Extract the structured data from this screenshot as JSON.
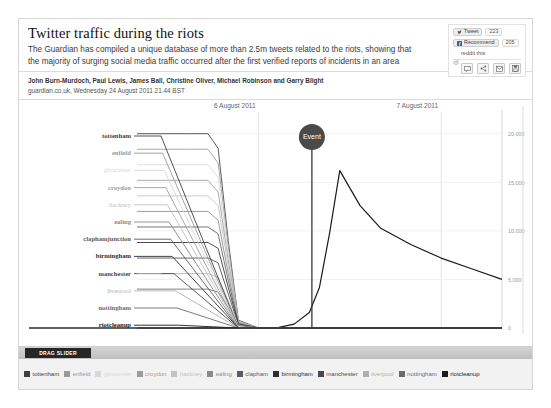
{
  "header": {
    "headline": "Twitter traffic during the riots",
    "standfirst": "The Guardian has compiled a unique database of more than 2.5m tweets related to the riots, showing that the majority of surging social media traffic occurred after the first verified reports of incidents in an area"
  },
  "social": {
    "tweet_label": "Tweet",
    "tweet_count": "223",
    "recommend_label": "Recommend",
    "recommend_count": "205",
    "reddit_label": "reddit this",
    "tools": [
      "comment-icon",
      "share-icon",
      "email-icon",
      "save-icon"
    ]
  },
  "byline": {
    "authors": "John Burn-Murdoch, Paul Lewis, James Ball, Christine Oliver, Michael Robinson and Garry Blight",
    "publication": "guardian.co.uk, Wednesday 24 August 2011 21.44 BST"
  },
  "slider": {
    "label": "DRAG SLIDER"
  },
  "chart_data": {
    "type": "line",
    "title": "Twitter traffic during the riots",
    "xlabel": "",
    "ylabel": "",
    "grid": true,
    "legend_position": "bottom",
    "annotations": [
      {
        "label": "Event",
        "x": "2011-08-07T00:30",
        "kind": "marker-circle"
      }
    ],
    "x_tick_labels": [
      "6 August 2011",
      "7 August 2011"
    ],
    "y_tick_labels": [
      "0",
      "5,000",
      "10,000",
      "15,000",
      "20,000"
    ],
    "ylim": [
      0,
      21000
    ],
    "yticks": [
      0,
      5000,
      10000,
      15000,
      20000
    ],
    "left_labels": [
      "tottenham",
      "enfield",
      "gloucester",
      "croydon",
      "hackney",
      "ealing",
      "claphamjunction",
      "birmingham",
      "manchester",
      "liverpool",
      "nottingham",
      "riotcleanup"
    ],
    "legend": [
      {
        "label": "tottenham",
        "color": "#3f3f3f"
      },
      {
        "label": "enfield",
        "color": "#9a9a9a"
      },
      {
        "label": "gloucester",
        "color": "#d8d8d8"
      },
      {
        "label": "croydon",
        "color": "#9d9d9d"
      },
      {
        "label": "hackney",
        "color": "#c2c2c2"
      },
      {
        "label": "ealing",
        "color": "#8a8a8a"
      },
      {
        "label": "clapham",
        "color": "#5c5c5c"
      },
      {
        "label": "birmingham",
        "color": "#2e2e2e"
      },
      {
        "label": "manchester",
        "color": "#4a4a4a"
      },
      {
        "label": "liverpool",
        "color": "#b0b0b0"
      },
      {
        "label": "nottingham",
        "color": "#6b6b6b"
      },
      {
        "label": "riotcleanup",
        "color": "#1a1a1a"
      }
    ],
    "series": [
      {
        "name": "riotcleanup",
        "color": "#1a1a1a",
        "x": [
          0,
          6,
          12,
          18,
          24,
          28,
          31,
          34,
          36,
          38,
          40,
          44,
          48,
          54,
          60,
          66,
          72
        ],
        "values": [
          0,
          0,
          0,
          0,
          0,
          60,
          400,
          1600,
          4200,
          9800,
          16200,
          12600,
          10300,
          8600,
          7200,
          6100,
          5000
        ]
      },
      {
        "name": "tottenham",
        "color": "#3f3f3f",
        "x": [
          0,
          10,
          14,
          16,
          18,
          20,
          24,
          36,
          72
        ],
        "values": [
          20000,
          20000,
          20000,
          18500,
          9000,
          800,
          0,
          0,
          0
        ]
      },
      {
        "name": "enfield",
        "color": "#9a9a9a",
        "x": [
          0,
          10,
          14,
          16,
          18,
          20,
          24,
          36,
          72
        ],
        "values": [
          18400,
          18400,
          18400,
          17000,
          8400,
          700,
          0,
          0,
          0
        ]
      },
      {
        "name": "gloucester",
        "color": "#d8d8d8",
        "x": [
          0,
          10,
          14,
          16,
          18,
          20,
          24,
          36,
          72
        ],
        "values": [
          16800,
          16800,
          16800,
          15500,
          7600,
          650,
          0,
          0,
          0
        ]
      },
      {
        "name": "croydon",
        "color": "#9d9d9d",
        "x": [
          0,
          10,
          14,
          16,
          18,
          20,
          24,
          36,
          72
        ],
        "values": [
          15200,
          15200,
          15200,
          14000,
          7000,
          600,
          0,
          0,
          0
        ]
      },
      {
        "name": "hackney",
        "color": "#c2c2c2",
        "x": [
          0,
          10,
          14,
          16,
          18,
          20,
          24,
          36,
          72
        ],
        "values": [
          13600,
          13600,
          13600,
          12600,
          6300,
          550,
          0,
          0,
          0
        ]
      },
      {
        "name": "ealing",
        "color": "#8a8a8a",
        "x": [
          0,
          10,
          14,
          16,
          18,
          20,
          24,
          36,
          72
        ],
        "values": [
          12000,
          12000,
          12000,
          11100,
          5600,
          500,
          0,
          0,
          0
        ]
      },
      {
        "name": "claphamjunction",
        "color": "#5c5c5c",
        "x": [
          0,
          10,
          14,
          16,
          18,
          20,
          24,
          36,
          72
        ],
        "values": [
          10400,
          10400,
          10400,
          9700,
          4900,
          450,
          0,
          0,
          0
        ]
      },
      {
        "name": "birmingham",
        "color": "#2e2e2e",
        "x": [
          0,
          10,
          14,
          16,
          18,
          20,
          24,
          36,
          72
        ],
        "values": [
          8800,
          8800,
          8800,
          8200,
          4200,
          400,
          0,
          0,
          0
        ]
      },
      {
        "name": "manchester",
        "color": "#4a4a4a",
        "x": [
          0,
          10,
          14,
          16,
          18,
          20,
          24,
          36,
          72
        ],
        "values": [
          7200,
          7200,
          7200,
          6700,
          3500,
          350,
          0,
          0,
          0
        ]
      },
      {
        "name": "liverpool",
        "color": "#b0b0b0",
        "x": [
          0,
          10,
          14,
          16,
          18,
          20,
          24,
          36,
          72
        ],
        "values": [
          5600,
          5600,
          5600,
          5200,
          2800,
          300,
          0,
          0,
          0
        ]
      },
      {
        "name": "nottingham",
        "color": "#6b6b6b",
        "x": [
          0,
          10,
          14,
          16,
          18,
          20,
          24,
          36,
          72
        ],
        "values": [
          4000,
          4000,
          4000,
          3700,
          2100,
          250,
          0,
          0,
          0
        ]
      }
    ]
  }
}
